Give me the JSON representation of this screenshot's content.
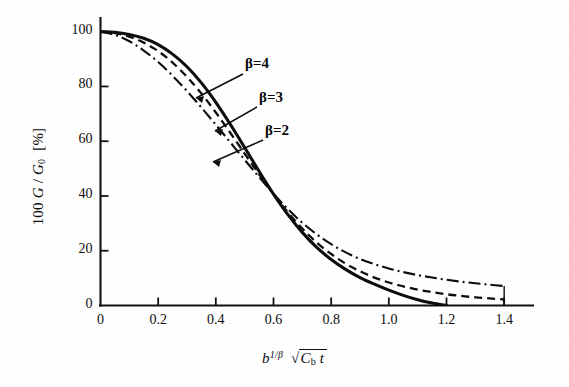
{
  "figure": {
    "background": "#ffffff",
    "ink_color": "#101010"
  },
  "chart_data": {
    "type": "line",
    "title": "",
    "subtitle": "",
    "xlabel": "b^(1/β) √(C_b t)",
    "ylabel": "100 G / G₀ [%]",
    "xlim": [
      0,
      1.5
    ],
    "ylim": [
      0,
      105
    ],
    "grid": false,
    "legend_position": "inline-annotations",
    "x_ticks": [
      0,
      0.2,
      0.4,
      0.6,
      0.8,
      1.0,
      1.2,
      1.4
    ],
    "x_tick_labels": [
      "0",
      "0.2",
      "0.4",
      "0.6",
      "0.8",
      "1.0",
      "1.2",
      "1.4"
    ],
    "y_ticks": [
      0,
      20,
      40,
      60,
      80,
      100
    ],
    "y_tick_labels": [
      "0",
      "20",
      "40",
      "60",
      "80",
      "100"
    ],
    "annotations": [
      {
        "text": "β=4",
        "target_x": 0.42,
        "target_y": 70
      },
      {
        "text": "β=3",
        "target_x": 0.46,
        "target_y": 63
      },
      {
        "text": "β=2",
        "target_x": 0.44,
        "target_y": 54
      }
    ],
    "series": [
      {
        "name": "β=4",
        "style": "solid",
        "color": "#0d0d0d",
        "x": [
          0.0,
          0.05,
          0.1,
          0.15,
          0.2,
          0.25,
          0.3,
          0.35,
          0.4,
          0.45,
          0.5,
          0.55,
          0.6,
          0.65,
          0.7,
          0.75,
          0.8,
          0.85,
          0.9,
          0.95,
          1.0,
          1.05,
          1.1,
          1.15,
          1.2
        ],
        "y": [
          100.0,
          99.8,
          99.0,
          97.6,
          95.3,
          91.8,
          87.2,
          81.3,
          74.2,
          66.2,
          57.7,
          49.0,
          40.7,
          33.2,
          26.7,
          21.2,
          16.8,
          13.2,
          10.2,
          7.8,
          5.6,
          3.7,
          2.1,
          0.9,
          0.0
        ]
      },
      {
        "name": "β=3",
        "style": "dashed",
        "color": "#0d0d0d",
        "x": [
          0.0,
          0.05,
          0.1,
          0.15,
          0.2,
          0.25,
          0.3,
          0.35,
          0.4,
          0.45,
          0.5,
          0.55,
          0.6,
          0.65,
          0.7,
          0.75,
          0.8,
          0.85,
          0.9,
          0.95,
          1.0,
          1.05,
          1.1,
          1.15,
          1.2,
          1.25,
          1.3,
          1.35,
          1.4
        ],
        "y": [
          100.0,
          99.5,
          98.2,
          96.0,
          92.9,
          88.7,
          83.5,
          77.4,
          70.5,
          63.1,
          55.5,
          47.9,
          40.7,
          34.0,
          28.1,
          23.0,
          18.8,
          15.3,
          12.5,
          10.2,
          8.4,
          7.0,
          5.8,
          4.9,
          4.1,
          3.5,
          3.0,
          2.6,
          2.2
        ]
      },
      {
        "name": "β=2",
        "style": "dash-dot",
        "color": "#0d0d0d",
        "x": [
          0.0,
          0.05,
          0.1,
          0.15,
          0.2,
          0.25,
          0.3,
          0.35,
          0.4,
          0.45,
          0.5,
          0.55,
          0.6,
          0.65,
          0.7,
          0.75,
          0.8,
          0.85,
          0.9,
          0.95,
          1.0,
          1.05,
          1.1,
          1.15,
          1.2,
          1.25,
          1.3,
          1.35,
          1.4
        ],
        "y": [
          100.0,
          98.8,
          96.5,
          93.1,
          88.9,
          83.9,
          78.3,
          72.3,
          66.0,
          59.6,
          53.2,
          46.9,
          40.8,
          35.2,
          30.2,
          26.0,
          22.4,
          19.4,
          17.0,
          15.1,
          13.5,
          12.2,
          11.1,
          10.2,
          9.4,
          8.7,
          8.1,
          7.6,
          7.1
        ]
      }
    ]
  },
  "axes": {
    "y_axis_caption_prefix": "100",
    "y_axis_caption_g": "G",
    "y_axis_caption_sep": "/",
    "y_axis_caption_g0": "G",
    "y_axis_caption_g0_sub": "0",
    "y_axis_caption_unit": "[%]",
    "x_axis_caption_b": "b",
    "x_axis_caption_exp": "1/β",
    "x_axis_caption_radical": "√",
    "x_axis_caption_cb": "C",
    "x_axis_caption_cb_sub": "b",
    "x_axis_caption_t": "t"
  }
}
